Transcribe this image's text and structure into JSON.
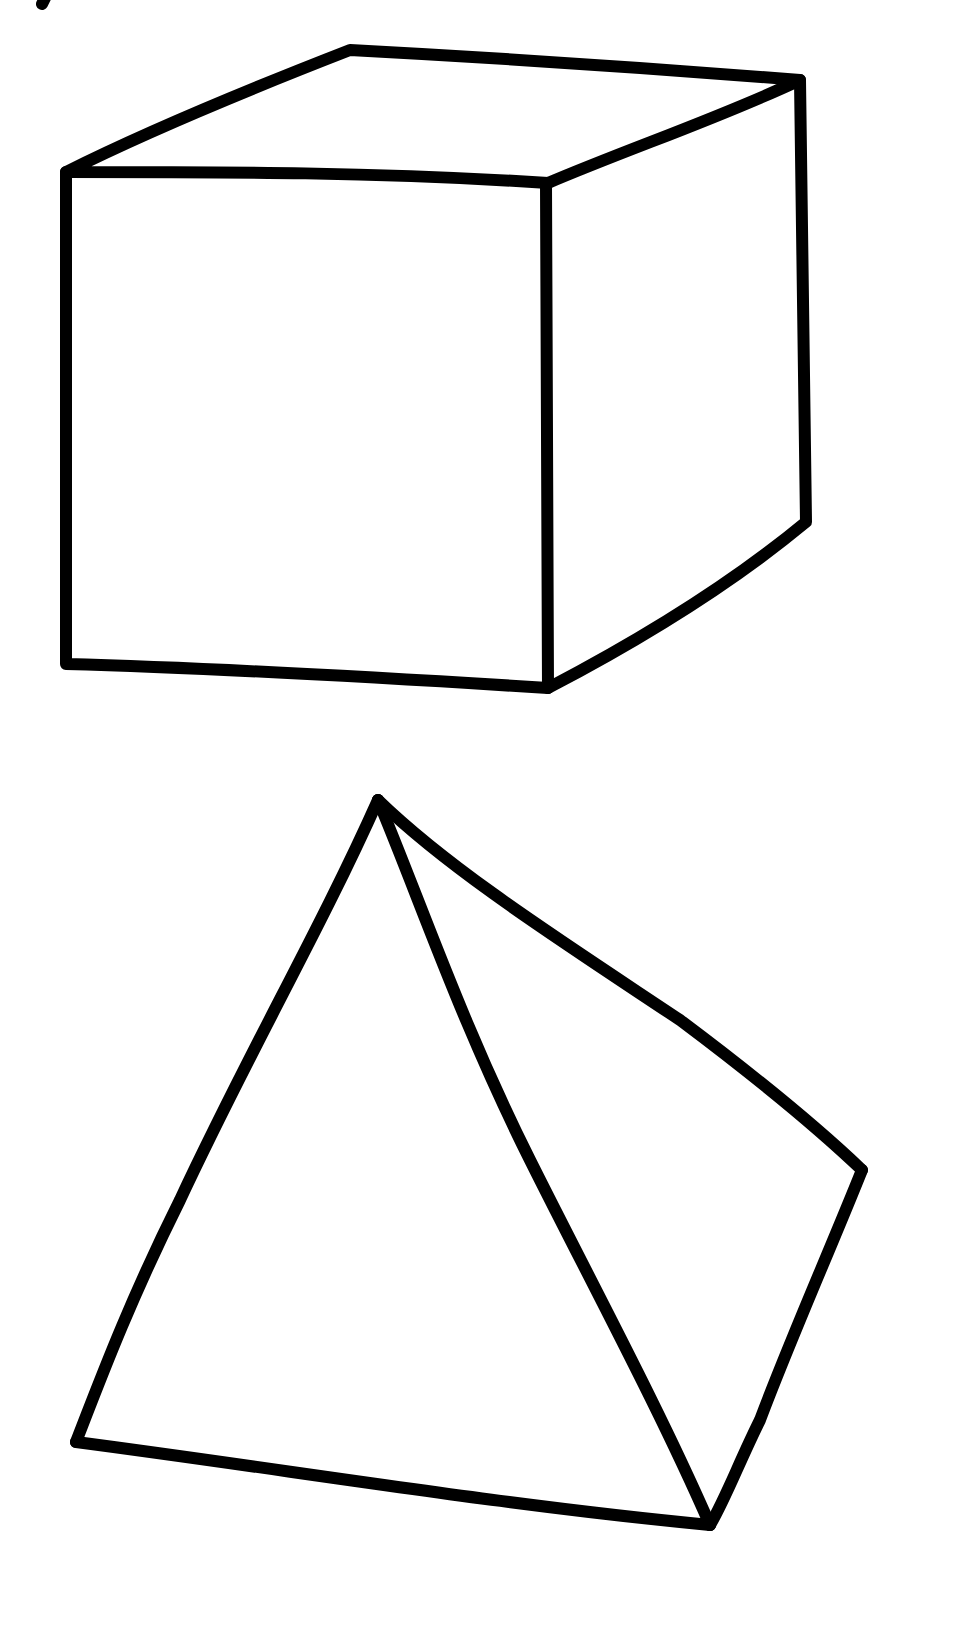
{
  "canvas": {
    "width": 974,
    "height": 1646,
    "background": "#ffffff",
    "stroke_color": "#000000"
  },
  "shapes": [
    {
      "name": "cube",
      "label": "cube drawing"
    },
    {
      "name": "pyramid",
      "label": "pyramid drawing"
    }
  ]
}
